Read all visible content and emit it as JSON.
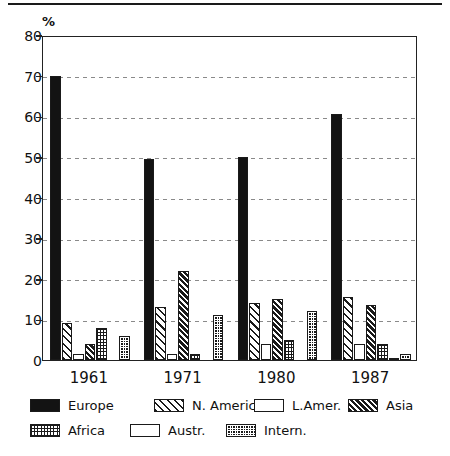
{
  "chart_data": {
    "type": "bar",
    "title": "",
    "xlabel": "",
    "ylabel": "%",
    "ylim": [
      0,
      80
    ],
    "yticks": [
      0,
      10,
      20,
      30,
      40,
      50,
      60,
      70,
      80
    ],
    "grid": true,
    "legend_position": "bottom",
    "categories": [
      "1961",
      "1971",
      "1980",
      "1987"
    ],
    "series": [
      {
        "name": "Europe",
        "pattern": "solid-black",
        "values": [
          70,
          49.5,
          50,
          60.5
        ]
      },
      {
        "name": "N. Americ",
        "pattern": "diagonal-hatch",
        "values": [
          9,
          13,
          14,
          15.5
        ]
      },
      {
        "name": "L.Amer.",
        "pattern": "light-dots",
        "values": [
          1.5,
          1.5,
          4,
          4
        ]
      },
      {
        "name": "Asia",
        "pattern": "dense-hatch",
        "values": [
          4,
          22,
          15,
          13.5
        ]
      },
      {
        "name": "Africa",
        "pattern": "fine-grid",
        "values": [
          8,
          1.5,
          5,
          4
        ]
      },
      {
        "name": "Austr.",
        "pattern": "white-empty",
        "values": [
          0,
          0,
          0,
          0.5
        ]
      },
      {
        "name": "Intern.",
        "pattern": "dark-checker",
        "values": [
          6,
          11,
          12,
          1.5
        ]
      }
    ]
  },
  "axis": {
    "unit_label": "%",
    "y_ticks": [
      "80",
      "70",
      "60",
      "50",
      "40",
      "30",
      "20",
      "10",
      "0"
    ],
    "x_labels": [
      "1961",
      "1971",
      "1980",
      "1987"
    ]
  },
  "legend": {
    "row1": [
      {
        "label": "Europe",
        "swatch": "solid-black-swatch"
      },
      {
        "label": "N. Americ",
        "swatch": "diagonal-hatch-swatch"
      },
      {
        "label": "L.Amer.",
        "swatch": "light-dots-swatch"
      },
      {
        "label": "Asia",
        "swatch": "dense-hatch-swatch"
      }
    ],
    "row2": [
      {
        "label": "Africa",
        "swatch": "fine-grid-swatch"
      },
      {
        "label": "Austr.",
        "swatch": "white-empty-swatch"
      },
      {
        "label": "Intern.",
        "swatch": "dark-checker-swatch"
      }
    ]
  },
  "colors": {
    "ink": "#131313",
    "grid": "#8a8a8a",
    "background": "#ffffff"
  }
}
